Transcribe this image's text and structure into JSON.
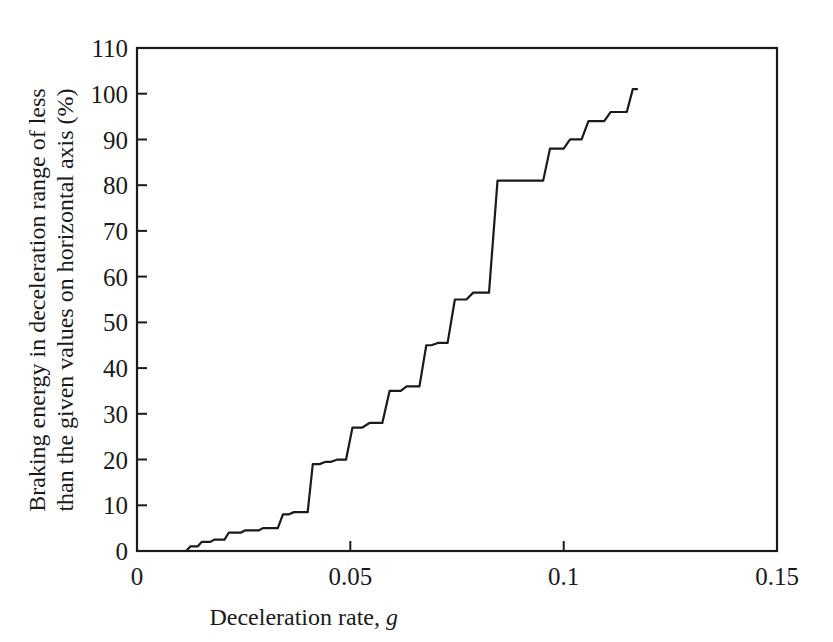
{
  "chart_data": {
    "type": "line",
    "title": "",
    "xlabel": "Deceleration rate, g",
    "xlabel_main": "Deceleration rate,",
    "xlabel_italic": "g",
    "ylabel": "Braking energy in deceleration range of less than the given values on horizontal axis (%)",
    "ylabel_line1": "Braking energy in deceleration range of less",
    "ylabel_line2": "than the given values on horizontal axis (%)",
    "xlim": [
      0,
      0.15
    ],
    "ylim": [
      0,
      110
    ],
    "xticks": [
      0,
      0.05,
      0.1,
      0.15
    ],
    "xtick_labels": [
      "0",
      "0.05",
      "0.1",
      "0.15"
    ],
    "yticks": [
      0,
      10,
      20,
      30,
      40,
      50,
      60,
      70,
      80,
      90,
      100,
      110
    ],
    "ytick_labels": [
      "0",
      "10",
      "20",
      "30",
      "40",
      "50",
      "60",
      "70",
      "80",
      "90",
      "100",
      "110"
    ],
    "grid": false,
    "legend": null,
    "line_color": "#1a1a1a",
    "line_width": 2.2,
    "step_style": "cumulative-staircase",
    "series": [
      {
        "name": "Cumulative braking energy",
        "x": [
          0.0,
          0.0115,
          0.0125,
          0.0142,
          0.0152,
          0.0172,
          0.0182,
          0.0205,
          0.0215,
          0.0243,
          0.0253,
          0.0285,
          0.0295,
          0.033,
          0.0342,
          0.0355,
          0.0368,
          0.04,
          0.0412,
          0.0428,
          0.0442,
          0.0455,
          0.047,
          0.049,
          0.0505,
          0.0528,
          0.0545,
          0.0575,
          0.0592,
          0.0618,
          0.0632,
          0.0662,
          0.0678,
          0.069,
          0.0705,
          0.0728,
          0.0745,
          0.0772,
          0.0788,
          0.0825,
          0.0845,
          0.0952,
          0.0968,
          0.1,
          0.1015,
          0.1042,
          0.1058,
          0.1095,
          0.111,
          0.1148,
          0.1162,
          0.1172
        ],
        "values": [
          0.0,
          0.0,
          1.0,
          1.0,
          2.0,
          2.0,
          2.5,
          2.5,
          4.0,
          4.0,
          4.5,
          4.5,
          5.0,
          5.0,
          8.0,
          8.0,
          8.5,
          8.5,
          19.0,
          19.0,
          19.5,
          19.5,
          20.0,
          20.0,
          27.0,
          27.0,
          28.0,
          28.0,
          35.0,
          35.0,
          36.0,
          36.0,
          45.0,
          45.0,
          45.5,
          45.5,
          55.0,
          55.0,
          56.5,
          56.5,
          81.0,
          81.0,
          88.0,
          88.0,
          90.0,
          90.0,
          94.0,
          94.0,
          96.0,
          96.0,
          101.0,
          101.0
        ]
      }
    ],
    "annotations": []
  }
}
